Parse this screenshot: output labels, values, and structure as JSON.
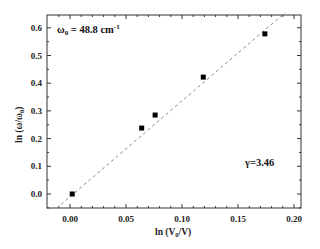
{
  "chart_data": {
    "type": "scatter",
    "title": "",
    "xlabel": "ln (V0/V)",
    "ylabel": "ln (ω/ω0)",
    "xlim": [
      -0.015,
      0.205
    ],
    "ylim": [
      -0.05,
      0.65
    ],
    "x_ticks": [
      "0.00",
      "0.05",
      "0.10",
      "0.15",
      "0.20"
    ],
    "y_ticks": [
      "0.0",
      "0.1",
      "0.2",
      "0.3",
      "0.4",
      "0.5",
      "0.6"
    ],
    "grid": false,
    "legend": null,
    "series": [
      {
        "name": "data",
        "marker": "square",
        "x": [
          0.002,
          0.064,
          0.076,
          0.119,
          0.174
        ],
        "y": [
          0.0,
          0.238,
          0.285,
          0.422,
          0.578
        ]
      },
      {
        "name": "linear fit",
        "style": "dashed",
        "slope": 3.46,
        "intercept": -0.01
      }
    ],
    "annotations": [
      {
        "text": "ω0 = 48.8 cm-1",
        "position": "top-left"
      },
      {
        "text": "γ=3.46",
        "position": "bottom-right"
      }
    ]
  },
  "labels": {
    "xlabel_main": "ln (V",
    "xlabel_sub": "0",
    "xlabel_end": "/V)",
    "ylabel_main": "ln (ω/ω",
    "ylabel_sub": "0",
    "ylabel_end": ")",
    "omega_main": "ω",
    "omega_sub": "0",
    "omega_rest": " = 48.8 cm",
    "omega_sup": "-1",
    "gamma": "γ=3.46"
  }
}
